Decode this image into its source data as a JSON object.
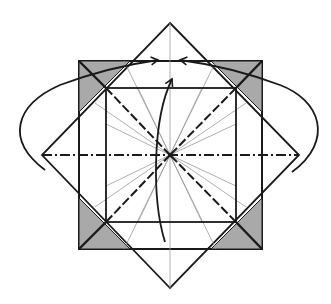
{
  "diagram": {
    "type": "origami-fold-diagram",
    "description": "Square base with rotated diamond; fold corner flaps to center",
    "colors": {
      "background": "#ffffff",
      "line": "#1a1a1a",
      "thin_line": "#9a9a9a",
      "shade": "#a9a9a9"
    },
    "center": [
      170,
      155
    ],
    "diamond": {
      "top": [
        170,
        23
      ],
      "right": [
        299,
        155
      ],
      "bottom": [
        170,
        288
      ],
      "left": [
        42,
        155
      ]
    },
    "outer_square": {
      "x1": 79,
      "y1": 61,
      "x2": 262,
      "y2": 249
    },
    "inner_square": {
      "x1": 106,
      "y1": 88,
      "x2": 236,
      "y2": 222
    },
    "fold_lines": {
      "mountain_fold": "horizontal dash-dot through center",
      "valley_fold": "diagonals from inner square corners to center",
      "reference_creases": 16
    },
    "arrows": [
      {
        "name": "left-flap-arrow",
        "from": [
          45,
          170
        ],
        "to": [
          158,
          61
        ]
      },
      {
        "name": "right-flap-arrow",
        "from": [
          292,
          172
        ],
        "to": [
          178,
          61
        ]
      },
      {
        "name": "bottom-flap-arrow",
        "from": [
          165,
          242
        ],
        "to": [
          172,
          78
        ]
      }
    ]
  }
}
